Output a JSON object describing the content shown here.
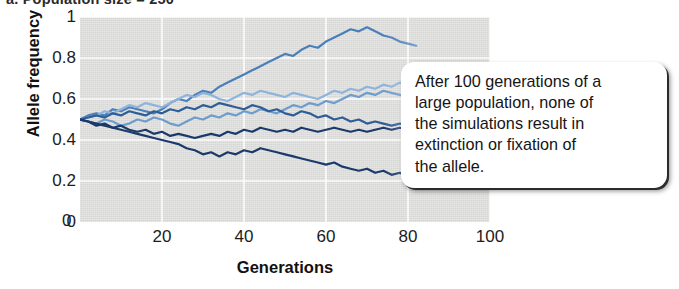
{
  "panel": {
    "label": "a. Population size = 250"
  },
  "callout": {
    "text": "After 100 generations of a\nlarge population, none of\nthe simulations result in\nextinction or fixation of\nthe allele."
  },
  "colors": {
    "plot_background": "#dcdcda",
    "gridline": "#ffffff",
    "series": [
      "#1b3a6b",
      "#2f5d96",
      "#4a7fba",
      "#6d9dcd",
      "#8fb4da",
      "#a9c6e2"
    ]
  },
  "chart_data": {
    "type": "line",
    "title": "a. Population size = 250",
    "xlabel": "Generations",
    "ylabel": "Allele frequency",
    "xlim": [
      0,
      100
    ],
    "ylim": [
      0,
      1
    ],
    "xticks": [
      0,
      20,
      40,
      60,
      80,
      100
    ],
    "xtick_labels": [
      "0",
      "20",
      "40",
      "60",
      "80",
      "100"
    ],
    "yticks": [
      0,
      0.2,
      0.4,
      0.6,
      0.8,
      1
    ],
    "ytick_labels": [
      "0",
      "0.2",
      "0.4",
      "0.6",
      "0.8",
      "1"
    ],
    "grid": true,
    "legend": "none",
    "annotation": "After 100 generations of a large population, none of the simulations result in extinction or fixation of the allele.",
    "note": "Six independent genetic-drift simulations all start at allele frequency 0.5; all remain strictly between 0 and 1 (no fixation or extinction). Traces are drawn to generation ~82 where the callout box occludes them.",
    "x": [
      0,
      2,
      4,
      6,
      8,
      10,
      12,
      14,
      16,
      18,
      20,
      22,
      24,
      26,
      28,
      30,
      32,
      34,
      36,
      38,
      40,
      42,
      44,
      46,
      48,
      50,
      52,
      54,
      56,
      58,
      60,
      62,
      64,
      66,
      68,
      70,
      72,
      74,
      76,
      78,
      80,
      82
    ],
    "series": [
      {
        "name": "simulation-1",
        "color": "#4a7fba",
        "values": [
          0.5,
          0.52,
          0.53,
          0.52,
          0.55,
          0.54,
          0.56,
          0.55,
          0.54,
          0.53,
          0.55,
          0.58,
          0.6,
          0.59,
          0.62,
          0.64,
          0.63,
          0.66,
          0.68,
          0.7,
          0.72,
          0.74,
          0.76,
          0.78,
          0.8,
          0.82,
          0.81,
          0.84,
          0.86,
          0.85,
          0.88,
          0.9,
          0.92,
          0.94,
          0.93,
          0.95,
          0.93,
          0.91,
          0.9,
          0.88,
          0.87,
          0.86
        ]
      },
      {
        "name": "simulation-2",
        "color": "#8fb4da",
        "values": [
          0.5,
          0.51,
          0.52,
          0.54,
          0.53,
          0.55,
          0.57,
          0.56,
          0.58,
          0.57,
          0.56,
          0.58,
          0.6,
          0.62,
          0.61,
          0.63,
          0.62,
          0.6,
          0.59,
          0.61,
          0.63,
          0.62,
          0.64,
          0.63,
          0.62,
          0.61,
          0.63,
          0.62,
          0.61,
          0.6,
          0.62,
          0.64,
          0.63,
          0.65,
          0.64,
          0.66,
          0.65,
          0.67,
          0.66,
          0.68,
          0.67,
          0.66
        ]
      },
      {
        "name": "simulation-3",
        "color": "#6d9dcd",
        "values": [
          0.5,
          0.49,
          0.48,
          0.5,
          0.49,
          0.47,
          0.48,
          0.5,
          0.49,
          0.51,
          0.5,
          0.48,
          0.47,
          0.49,
          0.51,
          0.5,
          0.52,
          0.51,
          0.53,
          0.52,
          0.54,
          0.53,
          0.55,
          0.54,
          0.53,
          0.55,
          0.57,
          0.56,
          0.58,
          0.57,
          0.59,
          0.58,
          0.6,
          0.62,
          0.61,
          0.63,
          0.62,
          0.64,
          0.63,
          0.62,
          0.61,
          0.6
        ]
      },
      {
        "name": "simulation-4",
        "color": "#2f5d96",
        "values": [
          0.5,
          0.51,
          0.52,
          0.51,
          0.53,
          0.52,
          0.54,
          0.53,
          0.52,
          0.54,
          0.53,
          0.55,
          0.54,
          0.56,
          0.55,
          0.57,
          0.56,
          0.58,
          0.57,
          0.56,
          0.55,
          0.57,
          0.56,
          0.54,
          0.55,
          0.53,
          0.52,
          0.54,
          0.53,
          0.51,
          0.52,
          0.5,
          0.51,
          0.49,
          0.5,
          0.48,
          0.49,
          0.48,
          0.47,
          0.48,
          0.47,
          0.46
        ]
      },
      {
        "name": "simulation-5",
        "color": "#1b3a6b",
        "values": [
          0.5,
          0.49,
          0.48,
          0.47,
          0.46,
          0.47,
          0.45,
          0.44,
          0.45,
          0.43,
          0.44,
          0.42,
          0.43,
          0.42,
          0.41,
          0.42,
          0.43,
          0.42,
          0.44,
          0.43,
          0.45,
          0.44,
          0.46,
          0.45,
          0.44,
          0.45,
          0.44,
          0.46,
          0.45,
          0.44,
          0.45,
          0.46,
          0.45,
          0.44,
          0.45,
          0.44,
          0.45,
          0.46,
          0.45,
          0.46,
          0.45,
          0.44
        ]
      },
      {
        "name": "simulation-6",
        "color": "#1b3a6b",
        "values": [
          0.5,
          0.49,
          0.47,
          0.48,
          0.46,
          0.45,
          0.44,
          0.43,
          0.42,
          0.41,
          0.4,
          0.39,
          0.38,
          0.36,
          0.35,
          0.33,
          0.34,
          0.32,
          0.34,
          0.33,
          0.35,
          0.34,
          0.36,
          0.35,
          0.34,
          0.33,
          0.32,
          0.31,
          0.3,
          0.29,
          0.28,
          0.29,
          0.27,
          0.26,
          0.25,
          0.26,
          0.24,
          0.25,
          0.23,
          0.24,
          0.22,
          0.21
        ]
      }
    ]
  }
}
